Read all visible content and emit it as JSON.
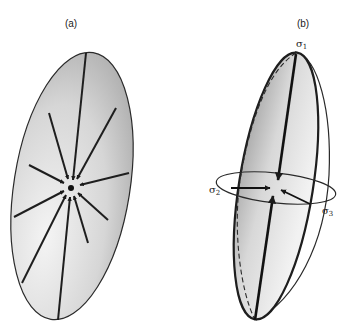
{
  "panels": {
    "a": {
      "label": "(a)"
    },
    "b": {
      "label": "(b)",
      "sigma1": "σ",
      "sigma1_sub": "1",
      "sigma2": "σ",
      "sigma2_sub": "2",
      "sigma3": "σ",
      "sigma3_sub": "3"
    }
  },
  "colors": {
    "fill_dark": "#a8a8a8",
    "fill_light": "#f2f2f2",
    "stroke": "#2a2a2a"
  }
}
